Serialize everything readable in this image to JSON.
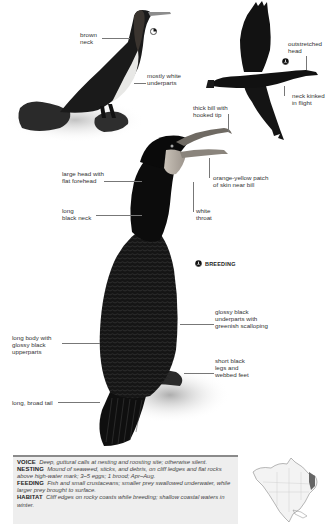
{
  "page": {
    "accent_colors": {
      "bird_black": "#111111",
      "label_text": "#333333",
      "leader_line": "#777777",
      "info_bg": "#eeeeee",
      "info_rule": "#8a8a8a"
    }
  },
  "top_left_bird": {
    "labels": [
      {
        "id": "brown-neck",
        "text": "brown\nneck"
      },
      {
        "id": "mostly-white-underparts",
        "text": "mostly white\nunderparts"
      }
    ],
    "symbol": "immature-symbol"
  },
  "flying_bird": {
    "labels": [
      {
        "id": "outstretched-head",
        "text": "outstretched\nhead"
      },
      {
        "id": "neck-kinked",
        "text": "neck kinked\nin flight"
      }
    ],
    "symbol": "flight-symbol"
  },
  "main_bird": {
    "labels": [
      {
        "id": "thick-bill",
        "text": "thick bill with\nhooked tip"
      },
      {
        "id": "orange-yellow-patch",
        "text": "orange-yellow patch\nof skin near bill"
      },
      {
        "id": "white-throat",
        "text": "white\nthroat"
      },
      {
        "id": "large-head",
        "text": "large head with\nflat forehead"
      },
      {
        "id": "long-black-neck",
        "text": "long\nblack neck"
      },
      {
        "id": "glossy-black-underparts",
        "text": "glossy black\nunderparts with\ngreenish scalloping"
      },
      {
        "id": "long-body",
        "text": "long body with\nglossy black\nupperparts"
      },
      {
        "id": "short-black-legs",
        "text": "short black\nlegs and\nwebbed feet"
      },
      {
        "id": "long-broad-tail",
        "text": "long, broad tail"
      }
    ],
    "breeding_label": "BREEDING",
    "symbol": "breeding-symbol"
  },
  "info": [
    {
      "heading": "VOICE",
      "text": "Deep, guttural calls at nesting and roosting site; otherwise silent."
    },
    {
      "heading": "NESTING",
      "text": "Mound of seaweed, sticks, and debris, on cliff ledges and flat rocks above high-water mark; 3–5 eggs; 1 brood; Apr–Aug."
    },
    {
      "heading": "FEEDING",
      "text": "Fish and small crustaceans; smaller prey swallowed underwater, while larger prey brought to surface."
    },
    {
      "heading": "HABITAT",
      "text": "Cliff edges on rocky coasts while breeding; shallow coastal waters in winter."
    }
  ],
  "range_map": {
    "region": "North America",
    "icon": "range-map-icon"
  }
}
